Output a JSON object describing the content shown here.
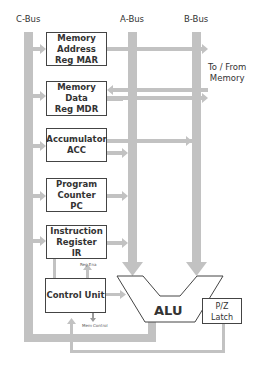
{
  "diagram": {
    "buses": {
      "c_bus": "C-Bus",
      "a_bus": "A-Bus",
      "b_bus": "B-Bus"
    },
    "memory_label": "To / From\nMemory",
    "registers": [
      {
        "id": "mar",
        "label": "Memory\nAddress\nReg MAR"
      },
      {
        "id": "mdr",
        "label": "Memory\nData\nReg MDR"
      },
      {
        "id": "acc",
        "label": "Accumulator\nACC"
      },
      {
        "id": "pc",
        "label": "Program\nCounter\nPC"
      },
      {
        "id": "ir",
        "label": "Instruction\nRegister\nIR"
      }
    ],
    "control_unit": "Control Unit",
    "alu": "ALU",
    "latch": "P/Z\nLatch",
    "signals": {
      "reg_enable": "Reg Ena",
      "mem_control": "Mem Control"
    },
    "colors": {
      "bus": "#bfbfbf",
      "box_border": "#444444",
      "text": "#333333"
    }
  }
}
